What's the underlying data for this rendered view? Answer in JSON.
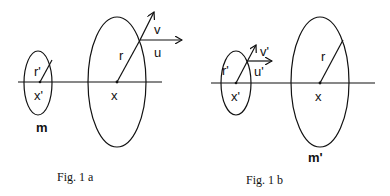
{
  "figures": [
    {
      "id": "fig1a",
      "caption": "Fig. 1 a",
      "small_body": {
        "radius_label": "r'",
        "center_label": "x'",
        "mass_label": "m"
      },
      "large_body": {
        "radius_label": "r",
        "center_label": "x"
      },
      "vectors": [
        {
          "label": "v",
          "on": "large_body"
        },
        {
          "label": "u",
          "on": "large_body"
        }
      ]
    },
    {
      "id": "fig1b",
      "caption": "Fig. 1 b",
      "small_body": {
        "radius_label": "r'",
        "center_label": "x'"
      },
      "large_body": {
        "radius_label": "r",
        "center_label": "x",
        "mass_label": "m'"
      },
      "vectors": [
        {
          "label": "v'",
          "on": "small_body"
        },
        {
          "label": "u'",
          "on": "small_body"
        }
      ]
    }
  ],
  "colors": {
    "stroke": "#111111",
    "background": "#ffffff"
  }
}
